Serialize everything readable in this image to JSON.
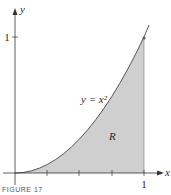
{
  "figure": {
    "caption": "FIGURE 17",
    "x_axis_label": "x",
    "y_axis_label": "y",
    "x_tick_label": "1",
    "y_tick_label": "1",
    "curve_label": "y = x²",
    "region_label": "R",
    "colors": {
      "axis": "#333333",
      "curve": "#555555",
      "region_fill": "#cfcfcf"
    }
  }
}
